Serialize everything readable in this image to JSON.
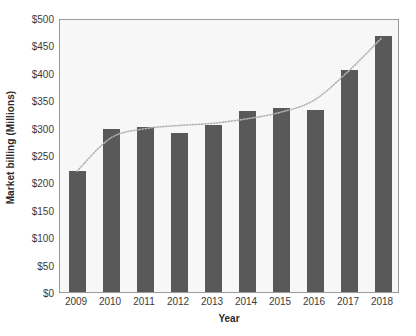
{
  "chart_data": {
    "type": "bar",
    "title": "",
    "subtitle": "",
    "xlabel": "Year",
    "ylabel": "Market billing (Millions)",
    "categories": [
      "2009",
      "2010",
      "2011",
      "2012",
      "2013",
      "2014",
      "2015",
      "2016",
      "2017",
      "2018"
    ],
    "values": [
      220,
      297,
      302,
      290,
      305,
      330,
      335,
      332,
      405,
      468
    ],
    "ylim": [
      0,
      500
    ],
    "ytick_values": [
      0,
      50,
      100,
      150,
      200,
      250,
      300,
      350,
      400,
      450,
      500
    ],
    "ytick_labels": [
      "$0",
      "$50",
      "$100",
      "$150",
      "$200",
      "$250",
      "$300",
      "$350",
      "$400",
      "$450",
      "$500"
    ],
    "grid": false,
    "legend": false,
    "legend_position": "none",
    "series": [
      {
        "name": "Market billing",
        "type": "bar",
        "color": "#595959",
        "values": [
          220,
          297,
          302,
          290,
          305,
          330,
          335,
          332,
          405,
          468
        ]
      },
      {
        "name": "Trend",
        "type": "line",
        "style": "dotted",
        "color": "#b3b3b3",
        "values": [
          222,
          283,
          300,
          306,
          310,
          318,
          330,
          352,
          404,
          466
        ]
      }
    ]
  },
  "colors": {
    "bar_fill": "#595959",
    "plot_background": "#f7f7f7",
    "plot_border": "#9a9a9a",
    "trendline": "#b3b3b3",
    "axis_text": "#3a3a3a",
    "axis_title_text": "#2b2b2b",
    "page_background": "#ffffff"
  }
}
